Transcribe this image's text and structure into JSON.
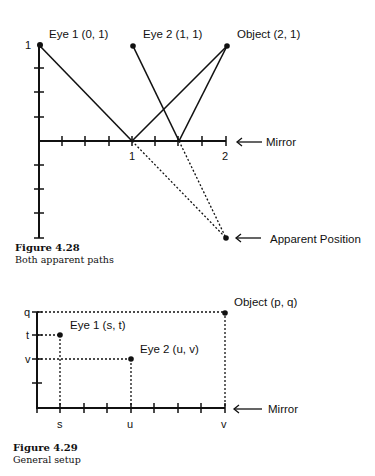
{
  "figure_1": {
    "number": "Figure 4.28",
    "caption": "Both apparent paths",
    "labels": {
      "eye1": "Eye 1 (0, 1)",
      "eye2": "Eye 2 (1, 1)",
      "object": "Object (2, 1)",
      "mirror": "Mirror",
      "apparent": "Apparent Position"
    },
    "tick_labels": {
      "y_top": "1",
      "x_1": "1",
      "x_2": "2"
    },
    "points": {
      "eye1": [
        0,
        1
      ],
      "eye2": [
        1,
        1
      ],
      "object": [
        2,
        1
      ],
      "apparent_position": [
        2,
        -1
      ]
    }
  },
  "figure_2": {
    "number": "Figure 4.29",
    "caption": "General setup",
    "labels": {
      "eye1": "Eye 1 (s, t)",
      "eye2": "Eye 2 (u, v)",
      "object": "Object (p, q)",
      "mirror": "Mirror"
    },
    "tick_labels": {
      "y": [
        "q",
        "t",
        "v"
      ],
      "x": [
        "s",
        "u",
        "v"
      ]
    }
  },
  "colors": {
    "ink": "#111111",
    "background": "#ffffff"
  }
}
